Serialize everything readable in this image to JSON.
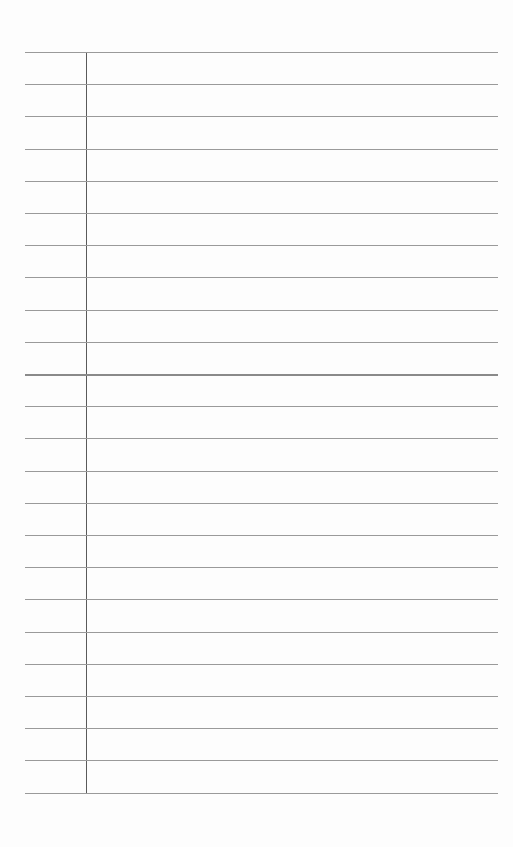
{
  "page": {
    "type": "lined-notepad",
    "background": "#fdfdfd",
    "rule_color": "#9a9a9a",
    "margin_color": "#5a5a5a",
    "line_count": 24,
    "first_line_y": 52,
    "line_spacing": 32.2,
    "strong_line_index": 10,
    "content": []
  }
}
